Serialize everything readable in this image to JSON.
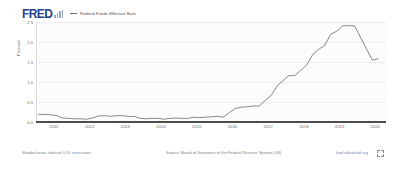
{
  "header": {
    "logo_text": "FRED",
    "logo_color": "#26408b",
    "legend_label": "Federal Funds Effective Rate",
    "legend_color": "#6a6a6a"
  },
  "footer": {
    "recession_note": "Shaded areas indicate U.S. recessions.",
    "source": "Source: Board of Governors of the Federal Reserve System (US)",
    "url": "fred.stlouisfed.org",
    "expand_icon": "expand-icon"
  },
  "chart_data": {
    "type": "line",
    "title": "Federal Funds Effective Rate",
    "xlabel": "",
    "ylabel": "Percent",
    "ylim": [
      0.0,
      2.5
    ],
    "yticks": [
      0.0,
      0.5,
      1.0,
      1.5,
      2.0,
      2.5
    ],
    "ytick_labels": [
      "0.0",
      "0.5",
      "1.0",
      "1.5",
      "2.0",
      "2.5"
    ],
    "xlim": [
      2010.5,
      2020.3
    ],
    "xticks": [
      2011,
      2012,
      2013,
      2014,
      2015,
      2016,
      2017,
      2018,
      2019,
      2020
    ],
    "xtick_labels": [
      "2011",
      "2012",
      "2013",
      "2014",
      "2015",
      "2016",
      "2017",
      "2018",
      "2019",
      "2020"
    ],
    "grid": true,
    "legend_position": "top",
    "series": [
      {
        "name": "Federal Funds Effective Rate",
        "color": "#6a6a6a",
        "units": "Percent",
        "x": [
          2010.58,
          2010.75,
          2010.92,
          2011.08,
          2011.25,
          2011.42,
          2011.58,
          2011.75,
          2011.92,
          2012.08,
          2012.25,
          2012.42,
          2012.58,
          2012.75,
          2012.92,
          2013.08,
          2013.25,
          2013.42,
          2013.58,
          2013.75,
          2013.92,
          2014.08,
          2014.25,
          2014.42,
          2014.58,
          2014.75,
          2014.92,
          2015.08,
          2015.25,
          2015.42,
          2015.58,
          2015.75,
          2015.92,
          2016.08,
          2016.25,
          2016.42,
          2016.58,
          2016.75,
          2016.92,
          2017.08,
          2017.25,
          2017.42,
          2017.58,
          2017.75,
          2017.92,
          2018.08,
          2018.25,
          2018.42,
          2018.58,
          2018.75,
          2018.92,
          2019.08,
          2019.25,
          2019.42,
          2019.58,
          2019.75,
          2019.92,
          2020.08
        ],
        "y": [
          0.19,
          0.19,
          0.18,
          0.16,
          0.1,
          0.09,
          0.08,
          0.08,
          0.07,
          0.1,
          0.15,
          0.16,
          0.14,
          0.16,
          0.16,
          0.14,
          0.14,
          0.09,
          0.08,
          0.09,
          0.09,
          0.07,
          0.09,
          0.1,
          0.09,
          0.09,
          0.12,
          0.11,
          0.12,
          0.13,
          0.14,
          0.12,
          0.24,
          0.34,
          0.37,
          0.38,
          0.4,
          0.4,
          0.54,
          0.66,
          0.9,
          1.04,
          1.16,
          1.16,
          1.3,
          1.42,
          1.69,
          1.82,
          1.91,
          2.19,
          2.27,
          2.4,
          2.41,
          2.4,
          2.13,
          1.83,
          1.55,
          1.58
        ]
      }
    ]
  }
}
